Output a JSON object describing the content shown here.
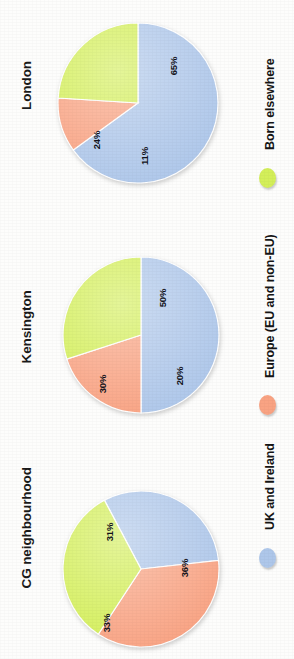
{
  "chart_data": {
    "type": "pie",
    "title": "",
    "subtitle": "",
    "xlabel": "",
    "ylabel": "",
    "grid": false,
    "orientation": "rotated-90",
    "legend_position": "right",
    "categories": [
      "UK and Ireland",
      "Europe (EU and non-EU)",
      "Born elsewhere"
    ],
    "colors": [
      "#aec7ea",
      "#f9a383",
      "#d4ef5a"
    ],
    "panels": [
      {
        "name": "London",
        "slices": [
          {
            "label": "UK and Ireland",
            "value": 65,
            "display": "65%",
            "color": "#aec7ea"
          },
          {
            "label": "Europe (EU and non-EU)",
            "value": 11,
            "display": "11%",
            "color": "#f9a383"
          },
          {
            "label": "Born elsewhere",
            "value": 24,
            "display": "24%",
            "color": "#d4ef5a"
          }
        ]
      },
      {
        "name": "Kensington",
        "slices": [
          {
            "label": "UK and Ireland",
            "value": 50,
            "display": "50%",
            "color": "#aec7ea"
          },
          {
            "label": "Europe (EU and non-EU)",
            "value": 20,
            "display": "20%",
            "color": "#f9a383"
          },
          {
            "label": "Born elsewhere",
            "value": 30,
            "display": "30%",
            "color": "#d4ef5a"
          }
        ]
      },
      {
        "name": "CG neighbourhood",
        "slices": [
          {
            "label": "UK and Ireland",
            "value": 31,
            "display": "31%",
            "color": "#aec7ea"
          },
          {
            "label": "Europe (EU and non-EU)",
            "value": 36,
            "display": "36%",
            "color": "#f9a383"
          },
          {
            "label": "Born elsewhere",
            "value": 33,
            "display": "33%",
            "color": "#d4ef5a"
          }
        ]
      }
    ]
  },
  "panel_labels": {
    "london": "London",
    "kensington": "Kensington",
    "cg": "CG neighbourhood"
  },
  "legend": {
    "items": [
      {
        "label": "Born elsewhere",
        "color": "#d4ef5a",
        "marker": "circle-marker-green"
      },
      {
        "label": "Europe (EU and non-EU)",
        "color": "#f9a383",
        "marker": "circle-marker-salmon"
      },
      {
        "label": "UK and Ireland",
        "color": "#aec7ea",
        "marker": "circle-marker-blue"
      }
    ]
  }
}
